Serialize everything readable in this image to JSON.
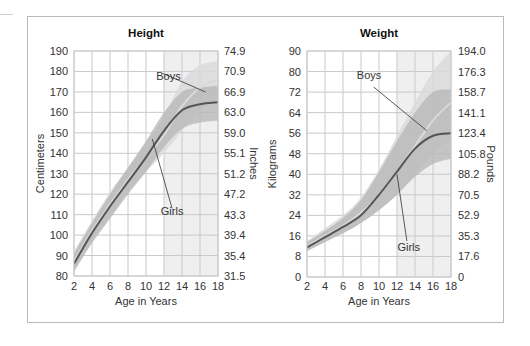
{
  "chart_data": [
    {
      "type": "line",
      "title": "Height",
      "xlabel": "Age in Years",
      "ylabel": "Centimeters",
      "ylabel_right": "Inches",
      "xlim": [
        2,
        18
      ],
      "ylim": [
        80,
        190
      ],
      "x_ticks": [
        "2",
        "4",
        "6",
        "8",
        "10",
        "12",
        "14",
        "16",
        "18"
      ],
      "y_ticks": [
        "80",
        "90",
        "100",
        "110",
        "120",
        "130",
        "140",
        "150",
        "160",
        "170",
        "180",
        "190"
      ],
      "y_ticks_right": [
        "31.5",
        "35.4",
        "39.4",
        "43.3",
        "47.2",
        "51.2",
        "55.1",
        "59.0",
        "63.0",
        "66.9",
        "70.9",
        "74.9"
      ],
      "shaded_x_range": [
        12,
        18
      ],
      "grid": true,
      "series": [
        {
          "name": "Boys",
          "x": [
            2,
            4,
            6,
            8,
            10,
            12,
            14,
            16,
            18
          ],
          "values": [
            87,
            102,
            115,
            127,
            138,
            149,
            163,
            172,
            176
          ],
          "band_low": [
            83,
            97,
            109,
            121,
            131,
            140,
            151,
            161,
            166
          ],
          "band_high": [
            92,
            107,
            121,
            133,
            145,
            158,
            175,
            183,
            185
          ]
        },
        {
          "name": "Girls",
          "x": [
            2,
            4,
            6,
            8,
            10,
            12,
            14,
            16,
            18
          ],
          "values": [
            86,
            101,
            114,
            126,
            138,
            151,
            161,
            164,
            165
          ],
          "band_low": [
            82,
            96,
            108,
            120,
            131,
            143,
            152,
            155,
            156
          ],
          "band_high": [
            91,
            106,
            120,
            133,
            146,
            160,
            170,
            172,
            173
          ]
        }
      ],
      "annotations": [
        {
          "text": "Boys",
          "x": 12.5,
          "y": 176
        },
        {
          "text": "Girls",
          "x": 12.9,
          "y": 110
        }
      ]
    },
    {
      "type": "line",
      "title": "Weight",
      "xlabel": "Age in Years",
      "ylabel": "Kilograms",
      "ylabel_right": "Pounds",
      "xlim": [
        2,
        18
      ],
      "ylim": [
        0,
        90
      ],
      "x_ticks": [
        "2",
        "4",
        "6",
        "8",
        "10",
        "12",
        "14",
        "16",
        "18"
      ],
      "y_ticks": [
        "0",
        "8",
        "16",
        "24",
        "32",
        "40",
        "48",
        "56",
        "64",
        "72",
        "80",
        "90"
      ],
      "y_ticks_right": [
        "0",
        "17.6",
        "35.3",
        "52.9",
        "70.5",
        "88.2",
        "105.8",
        "123.4",
        "141.1",
        "158.7",
        "176.3",
        "194.0"
      ],
      "shaded_x_range": [
        12,
        18
      ],
      "grid": true,
      "series": [
        {
          "name": "Boys",
          "x": [
            2,
            4,
            6,
            8,
            10,
            12,
            14,
            16,
            18
          ],
          "values": [
            12,
            16,
            20,
            25,
            32,
            41,
            51,
            61,
            68
          ],
          "band_low": [
            10,
            14,
            17,
            21,
            26,
            32,
            40,
            48,
            54
          ],
          "band_high": [
            14,
            19,
            24,
            31,
            42,
            55,
            68,
            80,
            90
          ]
        },
        {
          "name": "Girls",
          "x": [
            2,
            4,
            6,
            8,
            10,
            12,
            14,
            16,
            18
          ],
          "values": [
            11.5,
            15.5,
            19.5,
            24,
            32,
            41,
            50,
            55,
            56
          ],
          "band_low": [
            10,
            13.5,
            17,
            21,
            26,
            32,
            39,
            44,
            46
          ],
          "band_high": [
            13.5,
            18,
            23,
            30,
            41,
            53,
            64,
            72,
            73
          ]
        }
      ],
      "annotations": [
        {
          "text": "Boys",
          "x": 8.9,
          "y": 77
        },
        {
          "text": "Girls",
          "x": 13.3,
          "y": 10
        }
      ]
    }
  ],
  "colors": {
    "background": "#ffffff",
    "frame": "#b9b9b9",
    "grid": "#c9c9c9",
    "shaded_region": "#efefef",
    "boys_band": "#dadada",
    "boys_band_outer": "#e6e6e6",
    "girls_band": "#b5b5b5",
    "boys_line": "#d9d9d9",
    "girls_line": "#555555",
    "leader_line": "#333333"
  }
}
